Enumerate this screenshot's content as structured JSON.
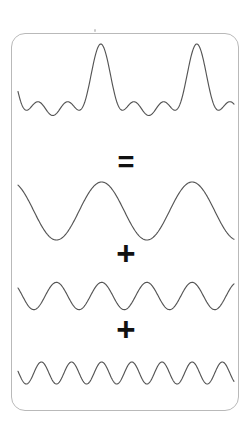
{
  "diagram": {
    "background_color": "#ffffff",
    "card": {
      "fill_color": "#ffffff",
      "border_color": "#b9b9b9",
      "corner_radius_px": 14
    },
    "stroke_color": "#555555",
    "operator_color": "#111111",
    "operators": {
      "equals": "=",
      "plus_1": "+",
      "plus_2": "+"
    }
  },
  "chart_data": {
    "type": "line",
    "xlabel": "",
    "ylabel": "",
    "grid": false,
    "legend": "none",
    "xlim": [
      0,
      1
    ],
    "ylim": [
      -1,
      1
    ],
    "relationship": "composite = component_1 + component_2 + component_3",
    "series": [
      {
        "name": "composite",
        "role": "sum",
        "description": "Jagged composite waveform, sum of the three sine components",
        "amplitude": 1.0,
        "cycles": null,
        "phase_deg": 90
      },
      {
        "name": "component_1",
        "role": "addend",
        "description": "Low frequency sine",
        "amplitude": 1.0,
        "cycles": 2.5,
        "phase_deg": 90
      },
      {
        "name": "component_2",
        "role": "addend",
        "description": "Mid frequency sine",
        "amplitude": 0.62,
        "cycles": 5,
        "phase_deg": 90
      },
      {
        "name": "component_3",
        "role": "addend",
        "description": "High frequency sine",
        "amplitude": 0.5,
        "cycles": 7.5,
        "phase_deg": 90
      }
    ]
  }
}
